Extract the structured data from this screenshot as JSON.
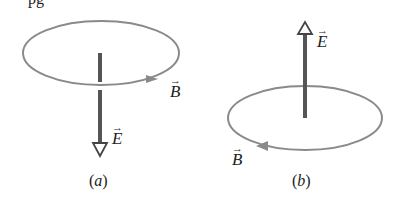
{
  "top_fragment": "pg",
  "panels": [
    {
      "id": "a",
      "caption_open": "(",
      "caption_letter": "a",
      "caption_close": ")",
      "e_label": "E",
      "b_label": "B",
      "e_direction": "down",
      "b_circulation": "counterclockwise-from-above (arrow on front moving right)"
    },
    {
      "id": "b",
      "caption_open": "(",
      "caption_letter": "b",
      "caption_close": ")",
      "e_label": "E",
      "b_label": "B",
      "e_direction": "up",
      "b_circulation": "clockwise-from-above (arrow on front moving left)"
    }
  ],
  "colors": {
    "loop": "#8a8a8a",
    "field_line": "#555555",
    "text": "#222222"
  }
}
